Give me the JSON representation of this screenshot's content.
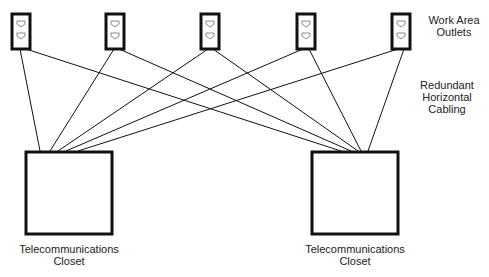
{
  "diagram": {
    "outlets_label": [
      "Work Area",
      "Outlets"
    ],
    "cabling_label": [
      "Redundant",
      "Horizontal",
      "Cabling"
    ],
    "closets": [
      {
        "label": [
          "Telecommunications",
          "Closet"
        ]
      },
      {
        "label": [
          "Telecommunications",
          "Closet"
        ]
      }
    ],
    "outlet_count": 5,
    "colors": {
      "stroke": "#111111",
      "background": "#ffffff",
      "text": "#222222"
    }
  }
}
